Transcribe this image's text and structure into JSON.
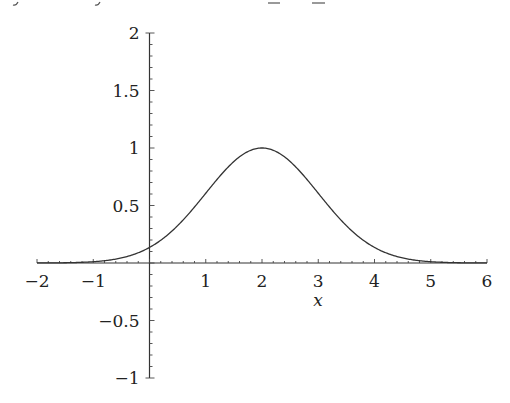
{
  "chart_data": {
    "type": "line",
    "title": "",
    "xlabel": "x",
    "ylabel": "",
    "xlim": [
      -2,
      6
    ],
    "ylim": [
      -1,
      2
    ],
    "grid": false,
    "legend": null,
    "x_ticks": [
      "−2",
      "−1",
      "1",
      "2",
      "3",
      "4",
      "5",
      "6"
    ],
    "x_tick_values": [
      -2,
      -1,
      1,
      2,
      3,
      4,
      5,
      6
    ],
    "y_ticks": [
      "2",
      "1.5",
      "1",
      "0.5",
      "−0.5",
      "−1"
    ],
    "y_tick_values": [
      2,
      1.5,
      1,
      0.5,
      -0.5,
      -1
    ],
    "series": [
      {
        "name": "exp(-(x-2)^2/2)",
        "x": [
          -2,
          -1.5,
          -1,
          -0.5,
          0,
          0.5,
          1,
          1.5,
          2,
          2.5,
          3,
          3.5,
          4,
          4.5,
          5,
          5.5,
          6
        ],
        "y": [
          0.0003,
          0.0022,
          0.0111,
          0.0439,
          0.1353,
          0.3247,
          0.6065,
          0.8825,
          1.0,
          0.8825,
          0.6065,
          0.3247,
          0.1353,
          0.0439,
          0.0111,
          0.0022,
          0.0003
        ]
      }
    ]
  },
  "axis_labels": {
    "x": "x"
  }
}
